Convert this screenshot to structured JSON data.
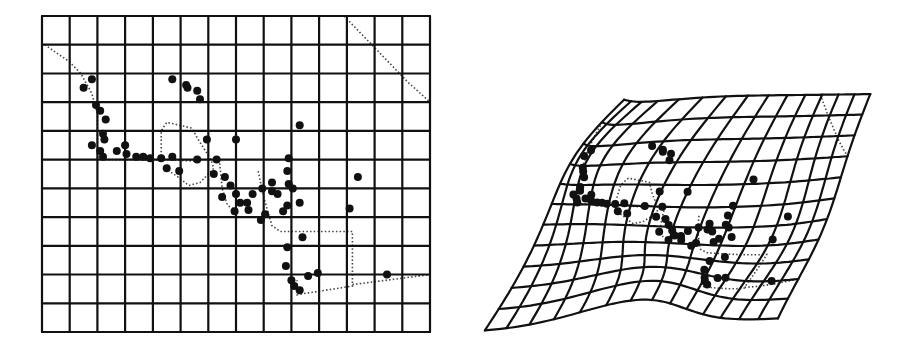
{
  "figure": {
    "panels": [
      {
        "id": "reference",
        "label": "",
        "cols": 14,
        "rows": 11,
        "bounds": {
          "x0": 42,
          "y0": 16,
          "x1": 430,
          "y1": 332
        }
      },
      {
        "id": "deformed",
        "label": "",
        "cols": 14,
        "rows": 11,
        "corners": {
          "tl": [
            648,
            96
          ],
          "tr": [
            870,
            94
          ],
          "bl": [
            485,
            331
          ],
          "br": [
            776,
            318
          ]
        }
      }
    ],
    "colors": {
      "grid": "#111111",
      "points": "#111111",
      "outline": "#444444",
      "background": "#ffffff"
    },
    "points": [
      [
        1.8,
        2.2
      ],
      [
        1.5,
        2.5
      ],
      [
        4.7,
        2.2
      ],
      [
        5.2,
        2.4
      ],
      [
        5.25,
        2.5
      ],
      [
        5.6,
        2.6
      ],
      [
        5.7,
        2.9
      ],
      [
        1.95,
        3.1
      ],
      [
        2.1,
        3.3
      ],
      [
        2.3,
        3.6
      ],
      [
        2.2,
        4.1
      ],
      [
        2.25,
        4.3
      ],
      [
        1.8,
        4.5
      ],
      [
        2.1,
        4.7
      ],
      [
        2.2,
        4.9
      ],
      [
        2.7,
        4.7
      ],
      [
        3.0,
        4.5
      ],
      [
        3.05,
        4.8
      ],
      [
        3.4,
        4.9
      ],
      [
        3.65,
        4.9
      ],
      [
        3.9,
        4.95
      ],
      [
        4.3,
        4.95
      ],
      [
        4.7,
        4.9
      ],
      [
        4.5,
        5.3
      ],
      [
        4.95,
        5.4
      ],
      [
        5.6,
        5.0
      ],
      [
        5.95,
        4.3
      ],
      [
        7.0,
        4.3
      ],
      [
        9.3,
        3.8
      ],
      [
        6.3,
        5.0
      ],
      [
        6.2,
        5.5
      ],
      [
        6.6,
        5.6
      ],
      [
        6.8,
        5.9
      ],
      [
        7.0,
        6.2
      ],
      [
        7.15,
        6.5
      ],
      [
        7.4,
        6.5
      ],
      [
        7.45,
        6.75
      ],
      [
        7.6,
        6.2
      ],
      [
        7.95,
        6.0
      ],
      [
        8.3,
        5.8
      ],
      [
        8.9,
        4.95
      ],
      [
        8.85,
        5.4
      ],
      [
        8.9,
        5.85
      ],
      [
        9.05,
        6.0
      ],
      [
        8.3,
        6.1
      ],
      [
        8.5,
        6.2
      ],
      [
        8.85,
        6.6
      ],
      [
        9.3,
        6.5
      ],
      [
        8.7,
        6.8
      ],
      [
        8.05,
        6.9
      ],
      [
        6.95,
        6.8
      ],
      [
        6.5,
        6.3
      ],
      [
        11.4,
        5.6
      ],
      [
        11.1,
        6.7
      ],
      [
        9.4,
        7.7
      ],
      [
        8.85,
        8.05
      ],
      [
        8.8,
        8.7
      ],
      [
        9.0,
        9.2
      ],
      [
        9.1,
        9.4
      ],
      [
        9.3,
        9.55
      ],
      [
        9.6,
        9.05
      ],
      [
        9.95,
        8.95
      ],
      [
        12.45,
        9.0
      ],
      [
        7.9,
        7.1
      ]
    ],
    "outline_paths": [
      [
        [
          0.1,
          1.0
        ],
        [
          1.0,
          1.6
        ],
        [
          1.4,
          2.0
        ],
        [
          1.8,
          2.7
        ],
        [
          2.0,
          3.4
        ],
        [
          2.0,
          4.0
        ],
        [
          2.0,
          4.9
        ],
        [
          2.3,
          5.0
        ],
        [
          3.0,
          5.0
        ],
        [
          4.5,
          5.0
        ],
        [
          5.5,
          5.05
        ]
      ],
      [
        [
          4.3,
          5.0
        ],
        [
          4.3,
          4.0
        ],
        [
          4.5,
          3.7
        ],
        [
          5.4,
          3.9
        ],
        [
          5.7,
          4.4
        ],
        [
          6.1,
          5.0
        ],
        [
          6.2,
          5.3
        ],
        [
          5.7,
          5.8
        ],
        [
          5.3,
          5.9
        ],
        [
          4.9,
          5.6
        ],
        [
          4.6,
          5.4
        ]
      ],
      [
        [
          6.4,
          5.0
        ],
        [
          6.5,
          6.0
        ],
        [
          6.7,
          6.6
        ],
        [
          6.9,
          6.7
        ]
      ],
      [
        [
          7.8,
          5.4
        ],
        [
          8.0,
          6.3
        ],
        [
          8.3,
          7.3
        ],
        [
          8.6,
          7.5
        ],
        [
          8.8,
          7.5
        ],
        [
          11.2,
          7.5
        ],
        [
          11.2,
          9.4
        ],
        [
          9.2,
          9.7
        ],
        [
          9.2,
          9.2
        ]
      ],
      [
        [
          11.2,
          9.35
        ],
        [
          14.0,
          9.0
        ]
      ],
      [
        [
          10.9,
          0.0
        ],
        [
          12.0,
          1.1
        ],
        [
          13.2,
          2.3
        ],
        [
          14.0,
          3.0
        ]
      ]
    ],
    "deformation": {
      "bumps": [
        {
          "c": 3.0,
          "r": 3.0,
          "dx": -40,
          "dy": 0,
          "s": 3.0
        },
        {
          "c": 2.0,
          "r": 1.5,
          "dx": -20,
          "dy": 8,
          "s": 2.0
        },
        {
          "c": 7.0,
          "r": 6.5,
          "dx": -15,
          "dy": 10,
          "s": 2.5
        },
        {
          "c": 6.5,
          "r": 10.5,
          "dx": 25,
          "dy": -28,
          "s": 2.4
        },
        {
          "c": 11.0,
          "r": 6.5,
          "dx": 18,
          "dy": 6,
          "s": 2.5
        }
      ]
    }
  }
}
